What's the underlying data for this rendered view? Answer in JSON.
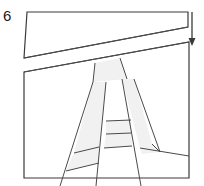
{
  "figure": {
    "step_number": "6",
    "title_text": "6",
    "canvas": {
      "width": 204,
      "height": 186
    },
    "colors": {
      "stroke": "#3a3a3a",
      "stroke_light": "#6b6b6b",
      "panel_fill": "#ffffff",
      "shape_fill": "#f1f1f1",
      "background": "#ffffff",
      "label": "#1a1a1a"
    },
    "stroke_widths": {
      "frame": 1.2,
      "interior": 1.0,
      "arrow": 1.3
    },
    "arrow": {
      "name": "down-arrow",
      "direction": "down",
      "x": 192,
      "y_start": 12,
      "y_end": 46,
      "head_width": 6,
      "head_height": 8
    },
    "panels": [
      {
        "name": "upper-panel",
        "points": "27,12 188,12 188,27 24,58"
      },
      {
        "name": "lower-panel",
        "points": "24,72 189,42 189,178 24,178"
      }
    ],
    "shapes": [
      {
        "name": "apex-piece",
        "points": "95,63 120,58 127,79 93,82",
        "fill": "shape_fill"
      },
      {
        "name": "left-leg-upper",
        "points": "93,82 106,82 99,147 74,153",
        "fill": "shape_fill"
      },
      {
        "name": "left-leg-lower",
        "points": "74,153 99,147 99,163 66,171",
        "fill": "shape_fill"
      },
      {
        "name": "right-leg-upper",
        "points": "122,79 134,79 152,144 140,148",
        "fill": "shape_fill"
      },
      {
        "name": "rung-upper",
        "points": "106,121 131,120 131,133 106,134",
        "fill": "shape_fill"
      },
      {
        "name": "rung-lower",
        "points": "106,134 131,133 132,146 104,148",
        "fill": "shape_fill"
      },
      {
        "name": "right-foot-wedge",
        "points": "140,148 152,144 160,152 142,154",
        "fill": "shape_fill"
      }
    ],
    "interior_lines": [
      {
        "name": "upper-panel-lower-edge",
        "x1": 24,
        "y1": 58,
        "x2": 188,
        "y2": 27
      },
      {
        "name": "lower-panel-top-edge",
        "x1": 24,
        "y1": 72,
        "x2": 189,
        "y2": 42
      },
      {
        "name": "apex-left-line",
        "x1": 95,
        "y1": 63,
        "x2": 93,
        "y2": 82
      },
      {
        "name": "apex-right-line",
        "x1": 120,
        "y1": 58,
        "x2": 127,
        "y2": 79
      },
      {
        "name": "left-rail-outer",
        "x1": 93,
        "y1": 82,
        "x2": 60,
        "y2": 186
      },
      {
        "name": "left-rail-inner",
        "x1": 106,
        "y1": 82,
        "x2": 96,
        "y2": 186
      },
      {
        "name": "right-rail-inner",
        "x1": 122,
        "y1": 79,
        "x2": 141,
        "y2": 186
      },
      {
        "name": "right-rail-outer",
        "x1": 134,
        "y1": 79,
        "x2": 160,
        "y2": 152
      },
      {
        "name": "rung-upper-top",
        "x1": 106,
        "y1": 121,
        "x2": 131,
        "y2": 120
      },
      {
        "name": "rung-upper-bottom",
        "x1": 106,
        "y1": 134,
        "x2": 131,
        "y2": 133
      },
      {
        "name": "rung-lower-bottom",
        "x1": 104,
        "y1": 148,
        "x2": 132,
        "y2": 146
      },
      {
        "name": "left-foot-line",
        "x1": 66,
        "y1": 171,
        "x2": 99,
        "y2": 163
      },
      {
        "name": "left-mid-line",
        "x1": 74,
        "y1": 153,
        "x2": 99,
        "y2": 147
      },
      {
        "name": "right-foot-line",
        "x1": 140,
        "y1": 148,
        "x2": 189,
        "y2": 156
      },
      {
        "name": "right-wedge-line",
        "x1": 152,
        "y1": 144,
        "x2": 160,
        "y2": 152
      }
    ]
  }
}
